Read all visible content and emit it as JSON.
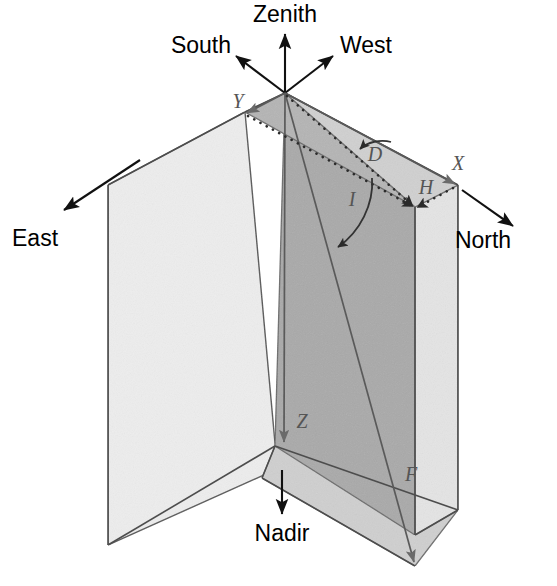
{
  "diagram": {
    "background_color": "#ffffff",
    "cardinal_directions": [
      {
        "id": "zenith",
        "label": "Zenith"
      },
      {
        "id": "south",
        "label": "South"
      },
      {
        "id": "west",
        "label": "West"
      },
      {
        "id": "east",
        "label": "East"
      },
      {
        "id": "north",
        "label": "North"
      },
      {
        "id": "nadir",
        "label": "Nadir"
      }
    ],
    "axis_labels": [
      {
        "id": "x",
        "label": "X"
      },
      {
        "id": "y",
        "label": "Y"
      },
      {
        "id": "z",
        "label": "Z"
      },
      {
        "id": "h",
        "label": "H"
      },
      {
        "id": "f",
        "label": "F"
      }
    ],
    "angle_labels": [
      {
        "id": "declination",
        "label": "D"
      },
      {
        "id": "inclination",
        "label": "I"
      }
    ],
    "colors": {
      "plane_left_fill": "#ededed",
      "plane_mid_fill": "#a9a9a9",
      "plane_right_fill": "#e2e2e2",
      "plane_floor_fill": "#c9c9c9",
      "edge_stroke": "#5a5a5a",
      "vector_black": "#111111",
      "vector_gray": "#5a5a5a",
      "label_gray": "#555555",
      "label_black": "#000000"
    }
  }
}
